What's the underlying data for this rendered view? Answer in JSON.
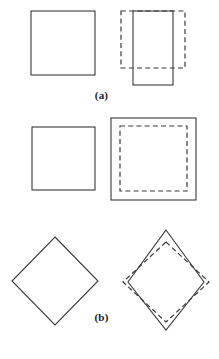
{
  "figure": {
    "title": "",
    "background_color": "#ffffff",
    "stroke_color": "#3a3a3a",
    "width": 219,
    "height": 359,
    "panels": [
      {
        "id": "a",
        "caption": "(a)",
        "description": "Square at left; at right a dashed square of the same size overlaid by a solid narrower, taller rectangle shifted downward.",
        "shapes": [
          {
            "name": "reference-square-a",
            "type": "rect",
            "style": "solid",
            "x": 31,
            "y": 11,
            "width": 64,
            "height": 64
          },
          {
            "name": "dashed-square-a",
            "type": "rect",
            "style": "dashed",
            "x": 121,
            "y": 11,
            "width": 64,
            "height": 57
          },
          {
            "name": "solid-rectangle-a",
            "type": "rect",
            "style": "solid",
            "x": 133,
            "y": 11,
            "width": 40,
            "height": 74
          }
        ]
      },
      {
        "id": "b",
        "caption": "(b)",
        "description": "Square at left; at right a larger solid square containing a smaller concentric dashed square.",
        "shapes": [
          {
            "name": "reference-square-b",
            "type": "rect",
            "style": "solid",
            "x": 32,
            "y": 17,
            "width": 63,
            "height": 63
          },
          {
            "name": "solid-outer-square-b",
            "type": "rect",
            "style": "solid",
            "x": 111,
            "y": 8,
            "width": 85,
            "height": 82
          },
          {
            "name": "dashed-inner-square-b",
            "type": "rect",
            "style": "dashed",
            "x": 120,
            "y": 16,
            "width": 67,
            "height": 65
          }
        ]
      },
      {
        "id": "c",
        "caption": "(c)",
        "description": "Diamond at left; at right a solid tall narrow diamond overlaid on a dashed wider, shorter diamond.",
        "shapes": [
          {
            "name": "reference-diamond-c",
            "type": "polygon",
            "style": "solid",
            "points": "55,12 98,56 55,100 12,56"
          },
          {
            "name": "dashed-diamond-c",
            "type": "polygon",
            "style": "dashed",
            "points": "166,17 209,57 166,97 123,57"
          },
          {
            "name": "solid-diamond-c",
            "type": "polygon",
            "style": "solid",
            "points": "166,5 204,57 166,105 128,57"
          }
        ]
      }
    ]
  }
}
